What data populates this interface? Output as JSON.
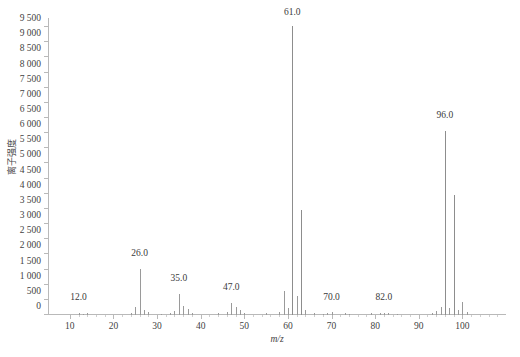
{
  "chart_data": {
    "type": "bar",
    "title": "",
    "xlabel": "m/z",
    "ylabel": "离子强度",
    "xlim": [
      5,
      110
    ],
    "ylim": [
      0,
      9800
    ],
    "grid": false,
    "legend": null,
    "y_ticks": [
      0,
      500,
      1000,
      1500,
      2000,
      2500,
      3000,
      3500,
      4000,
      4500,
      5000,
      5500,
      6000,
      6500,
      7000,
      7500,
      8000,
      8500,
      9000,
      9500
    ],
    "y_tick_labels": [
      "0",
      "500",
      "1 000",
      "1 500",
      "2 000",
      "2 500",
      "3 000",
      "3 500",
      "4 000",
      "4 500",
      "5 000",
      "5 500",
      "6 000",
      "6 500",
      "7 000",
      "7 500",
      "8 000",
      "8 500",
      "9 000",
      "9 500"
    ],
    "x_ticks": [
      10,
      20,
      30,
      40,
      50,
      60,
      70,
      80,
      90,
      100
    ],
    "x_tick_labels": [
      "10",
      "20",
      "30",
      "40",
      "50",
      "60",
      "70",
      "80",
      "90",
      "100"
    ],
    "x_minor_ticks": [
      12,
      14,
      16,
      18,
      22,
      24,
      26,
      28,
      32,
      34,
      36,
      38,
      42,
      44,
      46,
      48,
      52,
      54,
      56,
      58,
      62,
      64,
      66,
      68,
      72,
      74,
      76,
      78,
      82,
      84,
      86,
      88,
      92,
      94,
      96,
      98,
      102,
      104,
      106,
      108
    ],
    "categories": [
      12,
      13,
      14,
      24,
      25,
      26,
      27,
      28,
      31,
      33,
      34,
      35,
      36,
      37,
      38,
      44,
      46,
      47,
      48,
      49,
      50,
      55,
      58,
      59,
      60,
      61,
      62,
      63,
      64,
      66,
      68,
      69,
      70,
      73,
      74,
      79,
      81,
      82,
      83,
      85,
      93,
      94,
      95,
      96,
      97,
      98,
      99,
      100,
      101
    ],
    "values": [
      70,
      40,
      55,
      60,
      280,
      1520,
      180,
      90,
      50,
      60,
      130,
      690,
      300,
      190,
      70,
      60,
      110,
      380,
      260,
      160,
      70,
      60,
      90,
      780,
      230,
      9550,
      620,
      3480,
      180,
      60,
      50,
      70,
      90,
      60,
      50,
      60,
      70,
      80,
      60,
      50,
      70,
      120,
      260,
      6080,
      230,
      3960,
      150,
      420,
      90
    ],
    "annotations": [
      {
        "label": "12.0",
        "mz": 12,
        "y": 430
      },
      {
        "label": "26.0",
        "mz": 26,
        "y": 1880
      },
      {
        "label": "35.0",
        "mz": 35,
        "y": 1060
      },
      {
        "label": "47.0",
        "mz": 47,
        "y": 760
      },
      {
        "label": "61.0",
        "mz": 61,
        "y": 9820
      },
      {
        "label": "70.0",
        "mz": 70,
        "y": 430
      },
      {
        "label": "82.0",
        "mz": 82,
        "y": 430
      },
      {
        "label": "96.0",
        "mz": 96,
        "y": 6450
      }
    ]
  },
  "axis": {
    "y_title": "离子强度",
    "x_title": "m/z"
  },
  "caption": {
    "text": ""
  },
  "colors": {
    "peak": "#9a9a9a",
    "axis": "#b9b9b9",
    "text": "#3a3a3a"
  }
}
